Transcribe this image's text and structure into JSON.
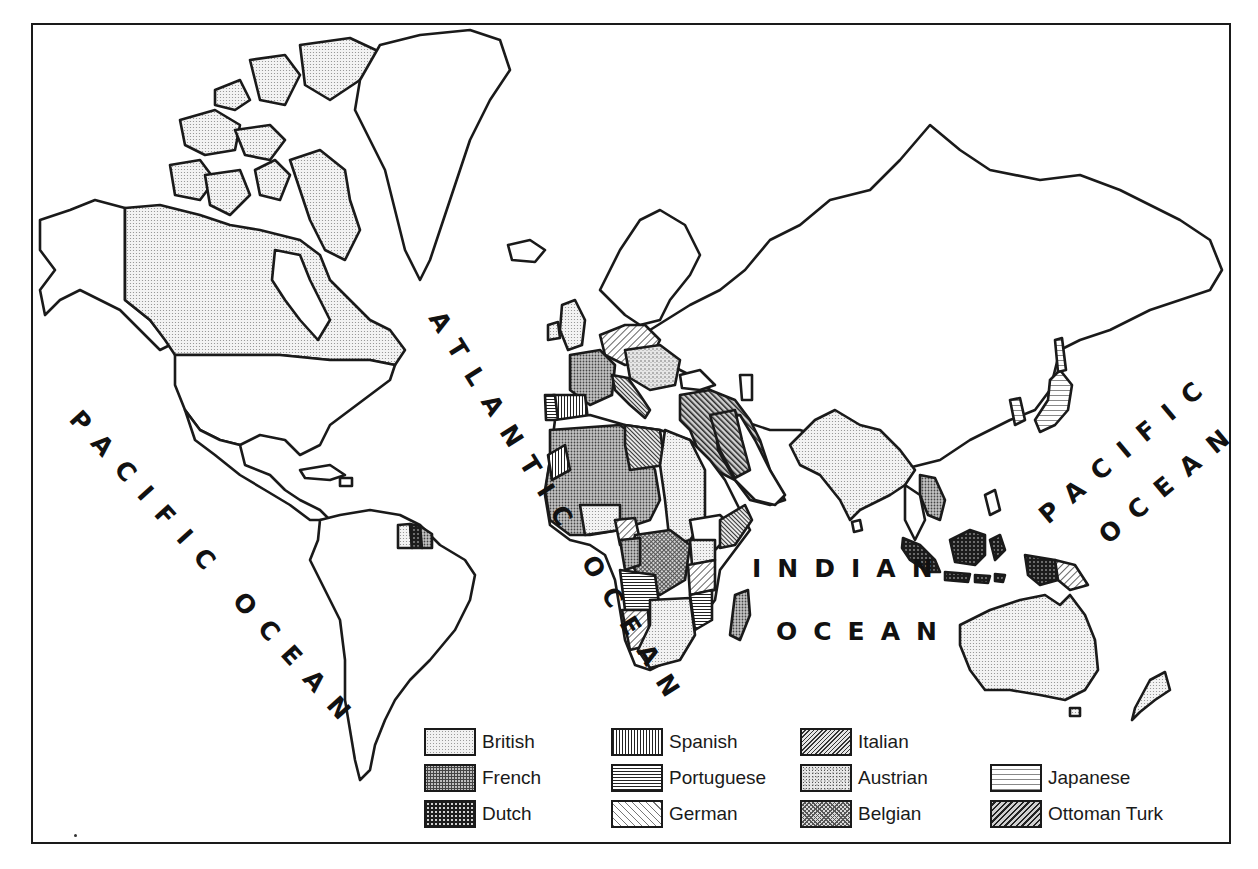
{
  "map": {
    "subject": "Colonial empires world map",
    "ocean_labels": [
      {
        "id": "pacific-west",
        "text": "PACIFIC OCEAN"
      },
      {
        "id": "atlantic",
        "text": "ATLANTIC OCEAN"
      },
      {
        "id": "indian-line1",
        "text": "INDIAN"
      },
      {
        "id": "indian-line2",
        "text": "OCEAN"
      },
      {
        "id": "pacific-east-line1",
        "text": "PACIFIC"
      },
      {
        "id": "pacific-east-line2",
        "text": "OCEAN"
      }
    ],
    "colors": {
      "ink": "#1a1a1a",
      "background": "#ffffff",
      "land_unclaimed": "#ffffff"
    }
  },
  "legend": {
    "items": [
      {
        "label": "British",
        "pattern": "fine-dots-light"
      },
      {
        "label": "French",
        "pattern": "dense-dots-medium"
      },
      {
        "label": "Dutch",
        "pattern": "dots-dark"
      },
      {
        "label": "Spanish",
        "pattern": "vertical-lines"
      },
      {
        "label": "Portuguese",
        "pattern": "horizontal-lines"
      },
      {
        "label": "German",
        "pattern": "diagonal-lines-light"
      },
      {
        "label": "Italian",
        "pattern": "diagonal-lines-dense"
      },
      {
        "label": "Austrian",
        "pattern": "stipple"
      },
      {
        "label": "Belgian",
        "pattern": "crosshatch"
      },
      {
        "label": "Japanese",
        "pattern": "horizontal-lines-sparse"
      },
      {
        "label": "Ottoman Turk",
        "pattern": "diagonal-lines-dark"
      }
    ]
  }
}
